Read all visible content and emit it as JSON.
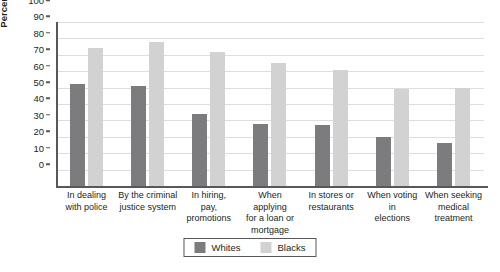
{
  "chart_data": {
    "type": "bar",
    "title": "",
    "xlabel": "",
    "ylabel": "Percentage",
    "ylim": [
      0,
      100
    ],
    "ytick_step": 10,
    "grid": true,
    "legend_position": "bottom-center",
    "categories": [
      "In dealing with police",
      "By the criminal justice system",
      "In hiring, pay, promotions",
      "When applying for a loan or mortgage",
      "In stores or restaurants",
      "When voting in elections",
      "When seeking medical treatment"
    ],
    "category_lines": [
      [
        "In dealing",
        "with police"
      ],
      [
        "By the criminal",
        "justice system"
      ],
      [
        "In hiring,",
        "pay,",
        "promotions"
      ],
      [
        "When applying",
        "for a loan or",
        "mortgage"
      ],
      [
        "In stores or",
        "restaurants"
      ],
      [
        "When voting in",
        "elections"
      ],
      [
        "When seeking",
        "medical",
        "treatment"
      ]
    ],
    "yticks": [
      "100",
      "90",
      "80",
      "70",
      "60",
      "50",
      "40",
      "30",
      "20",
      "10",
      "0"
    ],
    "series": [
      {
        "name": "Whites",
        "color": "#7c7c7e",
        "values": [
          62,
          61,
          44,
          38,
          37,
          30,
          26
        ]
      },
      {
        "name": "Blacks",
        "color": "#d2d2d3",
        "values": [
          84,
          88,
          82,
          75,
          71,
          59,
          60
        ]
      }
    ]
  }
}
